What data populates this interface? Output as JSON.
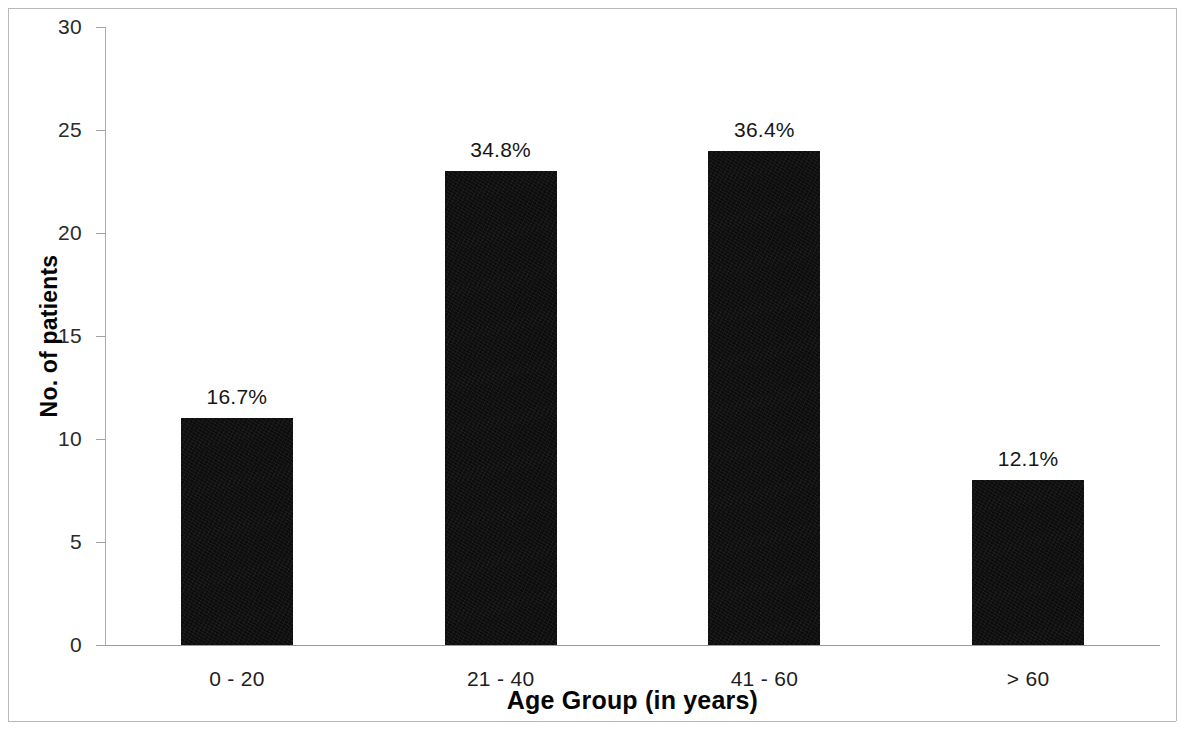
{
  "chart_data": {
    "type": "bar",
    "title": "",
    "xlabel": "Age Group (in years)",
    "ylabel": "No. of patients",
    "categories": [
      "0 - 20",
      "21 - 40",
      "41 - 60",
      "> 60"
    ],
    "values": [
      11,
      23,
      24,
      8
    ],
    "data_labels": [
      "16.7%",
      "34.8%",
      "36.4%",
      "12.1%"
    ],
    "ylim": [
      0,
      30
    ],
    "yticks": [
      0,
      5,
      10,
      15,
      20,
      25,
      30
    ],
    "ytick_labels": [
      "0",
      "5",
      "10",
      "15",
      "20",
      "25",
      "30"
    ],
    "grid": false,
    "legend": false,
    "legend_position": "none",
    "series": [
      {
        "name": "No. of patients",
        "values": [
          11,
          23,
          24,
          8
        ],
        "color": "#0d0d0d"
      }
    ]
  },
  "colors": {
    "bar": "#0d0d0d",
    "axis": "#9a9a9a",
    "text": "#161616",
    "background": "#ffffff",
    "border": "#b9b9b9"
  }
}
